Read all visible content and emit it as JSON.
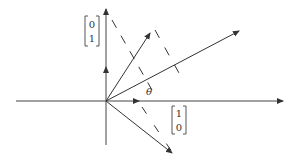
{
  "diagram": {
    "type": "vector-geometry",
    "origin": {
      "x": 106,
      "y": 101
    },
    "axes": {
      "x_axis": {
        "from": [
          16,
          101
        ],
        "to": [
          283,
          101
        ]
      },
      "y_axis": {
        "from": [
          106,
          145
        ],
        "to": [
          106,
          9
        ]
      }
    },
    "labels": {
      "e2": {
        "top": "0",
        "bottom": "1"
      },
      "e1": {
        "top": "1",
        "bottom": "0"
      },
      "theta": "θ"
    },
    "vectors": [
      {
        "name": "e1-unit",
        "to": [
          139,
          101
        ]
      },
      {
        "name": "e2-unit",
        "to": [
          106,
          68
        ]
      },
      {
        "name": "rotated-upper",
        "to": [
          150,
          33
        ]
      },
      {
        "name": "rotated-mid",
        "to": [
          239,
          31
        ]
      },
      {
        "name": "rotated-lower",
        "to": [
          172,
          153
        ]
      }
    ],
    "dashed_lines": [
      {
        "from": [
          112,
          20
        ],
        "to": [
          152,
          90
        ]
      },
      {
        "from": [
          152,
          25
        ],
        "to": [
          178,
          72
        ]
      },
      {
        "from": [
          142,
          108
        ],
        "to": [
          173,
          153
        ]
      }
    ],
    "colors": {
      "stroke": "#333333",
      "background": "#ffffff"
    }
  }
}
